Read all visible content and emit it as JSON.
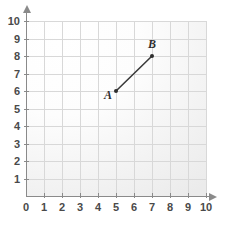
{
  "chart_data": {
    "type": "scatter",
    "title": "",
    "xlabel": "",
    "ylabel": "",
    "xlim": [
      0,
      10
    ],
    "ylim": [
      0,
      10
    ],
    "grid": true,
    "legend": false,
    "x_ticks": [
      "0",
      "1",
      "2",
      "3",
      "4",
      "5",
      "6",
      "7",
      "8",
      "9",
      "10"
    ],
    "y_ticks": [
      "1",
      "2",
      "3",
      "4",
      "5",
      "6",
      "7",
      "8",
      "9",
      "10"
    ],
    "x_tick_values": [
      0,
      1,
      2,
      3,
      4,
      5,
      6,
      7,
      8,
      9,
      10
    ],
    "y_tick_values": [
      1,
      2,
      3,
      4,
      5,
      6,
      7,
      8,
      9,
      10
    ],
    "points": [
      {
        "label": "A",
        "x": 5,
        "y": 6
      },
      {
        "label": "B",
        "x": 7,
        "y": 8
      }
    ],
    "segments": [
      {
        "from": "A",
        "to": "B"
      }
    ],
    "annotations": [
      {
        "text": "A",
        "x": 5,
        "y": 6,
        "position": "left"
      },
      {
        "text": "B",
        "x": 7,
        "y": 8,
        "position": "above"
      }
    ],
    "colors": {
      "grid": "#d8d8d8",
      "axis": "#8a8a8a",
      "point": "#2e2e2e",
      "segment": "#3a3a3a",
      "label": "#4a4a4a",
      "background": "#ffffff"
    }
  }
}
